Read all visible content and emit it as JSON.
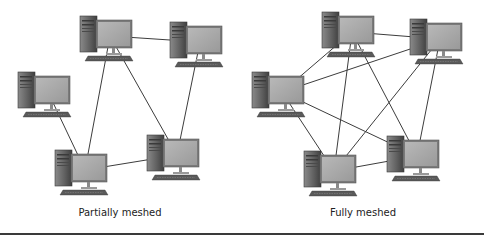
{
  "diagrams": [
    {
      "id": "partial",
      "caption": "Partially meshed",
      "nodes": [
        "A",
        "B",
        "C",
        "D",
        "E"
      ],
      "edges": [
        [
          "A",
          "B"
        ],
        [
          "A",
          "D"
        ],
        [
          "A",
          "E"
        ],
        [
          "B",
          "E"
        ],
        [
          "C",
          "D"
        ],
        [
          "D",
          "E"
        ]
      ]
    },
    {
      "id": "full",
      "caption": "Fully meshed",
      "nodes": [
        "A",
        "B",
        "C",
        "D",
        "E"
      ],
      "edges": [
        [
          "A",
          "B"
        ],
        [
          "A",
          "C"
        ],
        [
          "A",
          "D"
        ],
        [
          "A",
          "E"
        ],
        [
          "B",
          "C"
        ],
        [
          "B",
          "D"
        ],
        [
          "B",
          "E"
        ],
        [
          "C",
          "D"
        ],
        [
          "C",
          "E"
        ],
        [
          "D",
          "E"
        ]
      ]
    }
  ],
  "colors": {
    "link": "#3c3c3c",
    "tower": "#6e6e6e",
    "tower_dark": "#4a4a4a",
    "monitor_frame": "#7a7a7a",
    "monitor_screen": "#a9a9a9",
    "keyboard": "#555555",
    "caption": "#222222",
    "rule": "#3a3a3a"
  },
  "icons": {
    "node": "desktop-computer-icon"
  }
}
